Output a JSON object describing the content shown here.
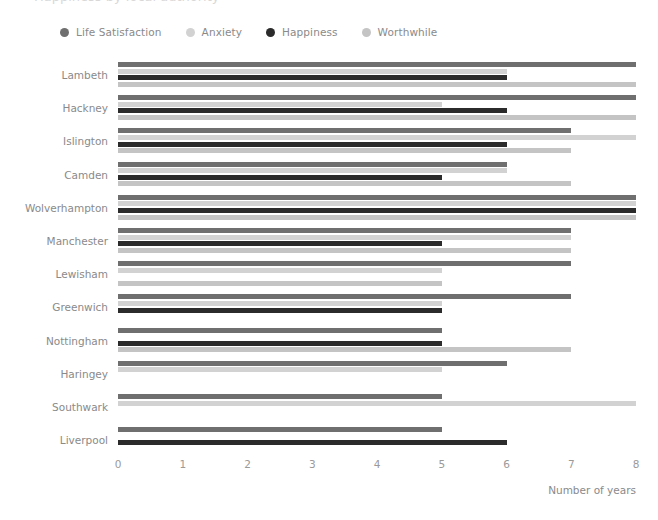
{
  "title": "Happiness by local authority",
  "legend": {
    "position": "top",
    "items": [
      {
        "label": "Life Satisfaction",
        "color": "#6f6f6f",
        "icon": "legend-dot-icon"
      },
      {
        "label": "Anxiety",
        "color": "#d2d2d2",
        "icon": "legend-dot-icon"
      },
      {
        "label": "Happiness",
        "color": "#2b2b2b",
        "icon": "legend-dot-icon"
      },
      {
        "label": "Worthwhile",
        "color": "#c4c4c4",
        "icon": "legend-dot-icon"
      }
    ]
  },
  "axis": {
    "x_title": "Number of years",
    "x_ticks": [
      "0",
      "1",
      "2",
      "3",
      "4",
      "5",
      "6",
      "7",
      "8"
    ]
  },
  "chart_data": {
    "type": "bar",
    "orientation": "horizontal",
    "title": "Happiness by local authority",
    "xlabel": "Number of years",
    "ylabel": "",
    "xlim": [
      0,
      8
    ],
    "grid": false,
    "legend_position": "top",
    "categories": [
      "Lambeth",
      "Hackney",
      "Islington",
      "Camden",
      "Wolverhampton",
      "Manchester",
      "Lewisham",
      "Greenwich",
      "Nottingham",
      "Haringey",
      "Southwark",
      "Liverpool"
    ],
    "series": [
      {
        "name": "Life Satisfaction",
        "color": "#6f6f6f",
        "values": [
          8,
          8,
          7,
          6,
          8,
          7,
          7,
          7,
          5,
          6,
          5,
          5
        ]
      },
      {
        "name": "Anxiety",
        "color": "#d2d2d2",
        "values": [
          6,
          5,
          8,
          6,
          8,
          7,
          5,
          5,
          0,
          5,
          8,
          0
        ]
      },
      {
        "name": "Happiness",
        "color": "#2b2b2b",
        "values": [
          6,
          6,
          6,
          5,
          8,
          5,
          0,
          5,
          5,
          0,
          0,
          6
        ]
      },
      {
        "name": "Worthwhile",
        "color": "#c4c4c4",
        "values": [
          8,
          8,
          7,
          7,
          8,
          7,
          5,
          0,
          7,
          0,
          0,
          0
        ]
      }
    ]
  }
}
